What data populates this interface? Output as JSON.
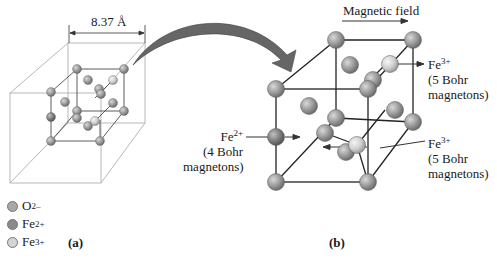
{
  "figure": {
    "panel_a": {
      "label": "(a)",
      "dimension": "8.37 Å"
    },
    "panel_b": {
      "label": "(b)",
      "field_label": "Magnetic field",
      "annotations": [
        {
          "ion": "Fe",
          "charge": "3+",
          "line1": "(5 Bohr",
          "line2": "magnetons)"
        },
        {
          "ion": "Fe",
          "charge": "2+",
          "line1": "(4 Bohr",
          "line2": "magnetons)"
        },
        {
          "ion": "Fe",
          "charge": "3+",
          "line1": "(5 Bohr",
          "line2": "magnetons)"
        }
      ]
    },
    "legend": [
      {
        "ion": "O",
        "charge": "2–",
        "color": "#a8a8a8"
      },
      {
        "ion": "Fe",
        "charge": "2+",
        "color": "#8a8a8a"
      },
      {
        "ion": "Fe",
        "charge": "3+",
        "color": "#d4d4d4"
      }
    ]
  }
}
